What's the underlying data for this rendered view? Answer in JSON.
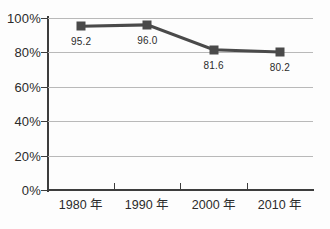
{
  "chart_data": {
    "type": "line",
    "title": "",
    "xlabel": "",
    "ylabel": "",
    "categories": [
      "1980 年",
      "1990 年",
      "2000 年",
      "2010 年"
    ],
    "values": [
      95.2,
      96.0,
      81.6,
      80.2
    ],
    "point_labels": [
      "95.2",
      "96.0",
      "81.6",
      "80.2"
    ],
    "ylim": [
      0,
      100
    ],
    "ytick_labels": [
      "0%",
      "20%",
      "40%",
      "60%",
      "80%",
      "100%"
    ],
    "ytick_values": [
      0,
      20,
      40,
      60,
      80,
      100
    ],
    "grid": true,
    "legend": "none",
    "series_color": "#4a4a4a",
    "grid_color": "#b9b9b9",
    "axis_color": "#3d3d3d",
    "background_color": "#fdfdfd"
  }
}
